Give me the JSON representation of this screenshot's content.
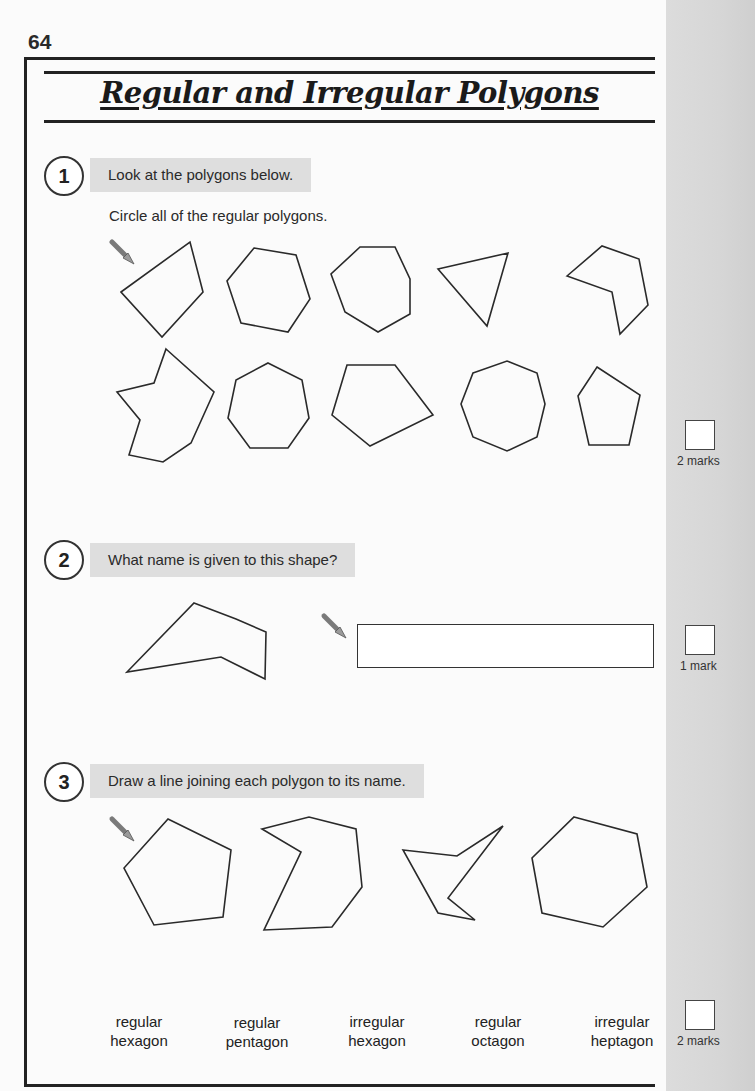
{
  "page": {
    "number": "64",
    "title": "Regular and Irregular Polygons"
  },
  "questions": [
    {
      "number": "1",
      "banner": "Look at the polygons below.",
      "instruction": "Circle all of the regular polygons.",
      "shapes_row1": [
        "irregular quadrilateral",
        "regular hexagon",
        "regular octagon",
        "irregular triangle",
        "irregular concave hexagon"
      ],
      "shapes_row2": [
        "irregular concave octagon",
        "regular heptagon",
        "regular pentagon",
        "regular octagon",
        "irregular pentagon"
      ],
      "marks": "2 marks"
    },
    {
      "number": "2",
      "banner": "What name is given to this shape?",
      "shape": "irregular concave pentagon",
      "answer_value": "",
      "marks": "1 mark"
    },
    {
      "number": "3",
      "banner": "Draw a line joining each polygon to its name.",
      "shapes": [
        "regular pentagon",
        "irregular heptagon",
        "irregular hexagon",
        "regular hexagon"
      ],
      "names": [
        {
          "line1": "regular",
          "line2": "hexagon"
        },
        {
          "line1": "regular",
          "line2": "pentagon"
        },
        {
          "line1": "irregular",
          "line2": "hexagon"
        },
        {
          "line1": "regular",
          "line2": "octagon"
        },
        {
          "line1": "irregular",
          "line2": "heptagon"
        }
      ],
      "marks": "2 marks"
    }
  ],
  "icons": {
    "pencil": "pencil-icon"
  },
  "colors": {
    "banner_bg": "#dedede",
    "margin_bg": "#d6d6d6",
    "ink": "#222222"
  }
}
